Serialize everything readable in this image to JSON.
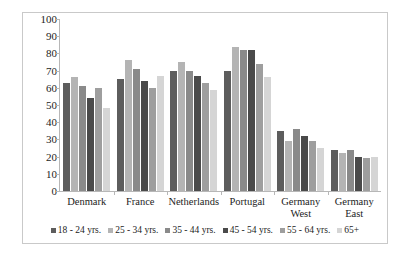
{
  "chart_data": {
    "type": "bar",
    "title": "",
    "subtitle": "",
    "xlabel": "",
    "ylabel": "",
    "ylim": [
      0,
      100
    ],
    "yticks": [
      0,
      10,
      20,
      30,
      40,
      50,
      60,
      70,
      80,
      90,
      100
    ],
    "grid": false,
    "legend_position": "bottom",
    "categories": [
      "Denmark",
      "France",
      "Netherlands",
      "Portugal",
      "Germany\nWest",
      "Germany\nEast"
    ],
    "series": [
      {
        "name": "18 - 24 yrs.",
        "color": "#5d5d5d",
        "values": [
          63,
          65,
          70,
          70,
          35,
          24
        ]
      },
      {
        "name": "25 - 34 yrs.",
        "color": "#b4b4b4",
        "values": [
          66,
          76,
          75,
          84,
          29,
          22
        ]
      },
      {
        "name": "35 - 44 yrs.",
        "color": "#8a8a8a",
        "values": [
          61,
          71,
          70,
          82,
          36,
          24
        ]
      },
      {
        "name": "45 - 54 yrs.",
        "color": "#4a4a4a",
        "values": [
          54,
          64,
          67,
          82,
          32,
          20
        ]
      },
      {
        "name": "55 - 64 yrs.",
        "color": "#9e9e9e",
        "values": [
          60,
          60,
          63,
          74,
          29,
          19
        ]
      },
      {
        "name": "65+",
        "color": "#d5d5d5",
        "values": [
          48,
          67,
          59,
          66,
          25,
          20
        ]
      }
    ]
  },
  "legend": {
    "items": [
      {
        "label": "18 - 24 yrs."
      },
      {
        "label": "25 - 34 yrs."
      },
      {
        "label": "35 - 44 yrs."
      },
      {
        "label": "45 - 54 yrs."
      },
      {
        "label": "55 - 64 yrs."
      },
      {
        "label": "65+"
      }
    ]
  },
  "axis": {
    "y_labels": [
      "100",
      "90",
      "80",
      "70",
      "60",
      "50",
      "40",
      "30",
      "20",
      "10",
      "0"
    ],
    "x_labels": [
      "Denmark",
      "France",
      "Netherlands",
      "Portugal",
      "Germany\nWest",
      "Germany\nEast"
    ]
  }
}
